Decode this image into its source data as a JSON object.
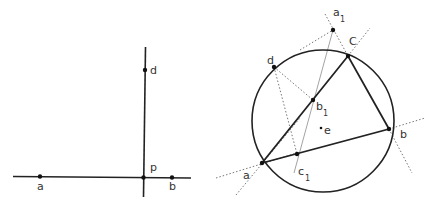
{
  "figure_left": {
    "labels": {
      "a": "a",
      "b": "b",
      "d": "d",
      "p": "p"
    }
  },
  "figure_right": {
    "labels": {
      "a": "a",
      "b": "b",
      "c": "C",
      "d": "d",
      "e": "e",
      "a1": "a",
      "a1_sub": "1",
      "b1": "b",
      "b1_sub": "1",
      "c1": "c",
      "c1_sub": "1"
    }
  },
  "colors": {
    "line": "#222222",
    "dotted": "#777777",
    "thin": "#999999"
  }
}
